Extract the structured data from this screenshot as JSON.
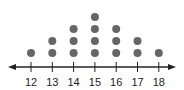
{
  "chart_data": {
    "type": "dot_plot",
    "title": "",
    "xlabel": "",
    "ylabel": "",
    "categories": [
      12,
      13,
      14,
      15,
      16,
      17,
      18
    ],
    "values": [
      1,
      2,
      3,
      4,
      3,
      2,
      1
    ],
    "xlim": [
      12,
      18
    ],
    "grid": false,
    "legend": null,
    "axis_arrows": true,
    "dot_color": "#666666",
    "axis_color": "#222222"
  },
  "axis": {
    "tick_labels": [
      "12",
      "13",
      "14",
      "15",
      "16",
      "17",
      "18"
    ]
  }
}
